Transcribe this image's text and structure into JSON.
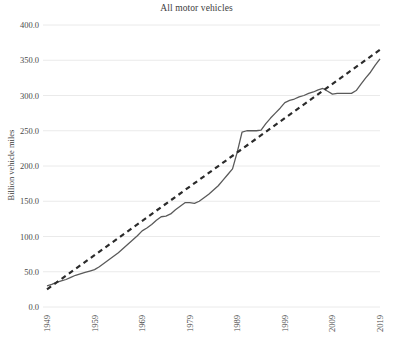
{
  "chart_data": {
    "type": "line",
    "title": "All motor vehicles",
    "xlabel": "",
    "ylabel": "Billion vehicle miles",
    "xlim": [
      1949,
      2019
    ],
    "ylim": [
      0,
      400
    ],
    "grid": true,
    "legend": "none",
    "y_ticks": [
      "0.0",
      "50.0",
      "100.0",
      "150.0",
      "200.0",
      "250.0",
      "300.0",
      "350.0",
      "400.0"
    ],
    "y_tick_values": [
      0,
      50,
      100,
      150,
      200,
      250,
      300,
      350,
      400
    ],
    "x_ticks": [
      "1949",
      "1959",
      "1969",
      "1979",
      "1989",
      "1999",
      "2009",
      "2019"
    ],
    "x_tick_values": [
      1949,
      1959,
      1969,
      1979,
      1989,
      1999,
      2009,
      2019
    ],
    "series": [
      {
        "name": "All motor vehicles",
        "style": "solid",
        "color": "#5a5a5a",
        "x": [
          1949,
          1950,
          1951,
          1952,
          1953,
          1954,
          1955,
          1956,
          1957,
          1958,
          1959,
          1960,
          1961,
          1962,
          1963,
          1964,
          1965,
          1966,
          1967,
          1968,
          1969,
          1970,
          1971,
          1972,
          1973,
          1974,
          1975,
          1976,
          1977,
          1978,
          1979,
          1980,
          1981,
          1982,
          1983,
          1984,
          1985,
          1986,
          1987,
          1988,
          1989,
          1990,
          1991,
          1992,
          1993,
          1994,
          1995,
          1996,
          1997,
          1998,
          1999,
          2000,
          2001,
          2002,
          2003,
          2004,
          2005,
          2006,
          2007,
          2008,
          2009,
          2010,
          2011,
          2012,
          2013,
          2014,
          2015,
          2016,
          2017,
          2018,
          2019
        ],
        "y": [
          30,
          32,
          35,
          37,
          39,
          42,
          45,
          47,
          49,
          51,
          53,
          57,
          62,
          67,
          72,
          77,
          83,
          89,
          95,
          101,
          108,
          112,
          117,
          123,
          128,
          129,
          132,
          138,
          143,
          148,
          148,
          147,
          150,
          155,
          160,
          166,
          172,
          180,
          188,
          196,
          220,
          248,
          250,
          250,
          250,
          251,
          260,
          268,
          275,
          282,
          290,
          293,
          295,
          298,
          300,
          303,
          305,
          308,
          310,
          306,
          302,
          303,
          303,
          303,
          303,
          307,
          316,
          325,
          333,
          343,
          352
        ]
      },
      {
        "name": "Linear trend",
        "style": "dashed",
        "color": "#2b2b2b",
        "x": [
          1949,
          2019
        ],
        "y": [
          25,
          365
        ]
      }
    ],
    "colors": {
      "gridline": "#eaeaea",
      "axis_text": "#4a4a4a",
      "title_text": "#3d3d3d",
      "background": "#ffffff"
    }
  }
}
